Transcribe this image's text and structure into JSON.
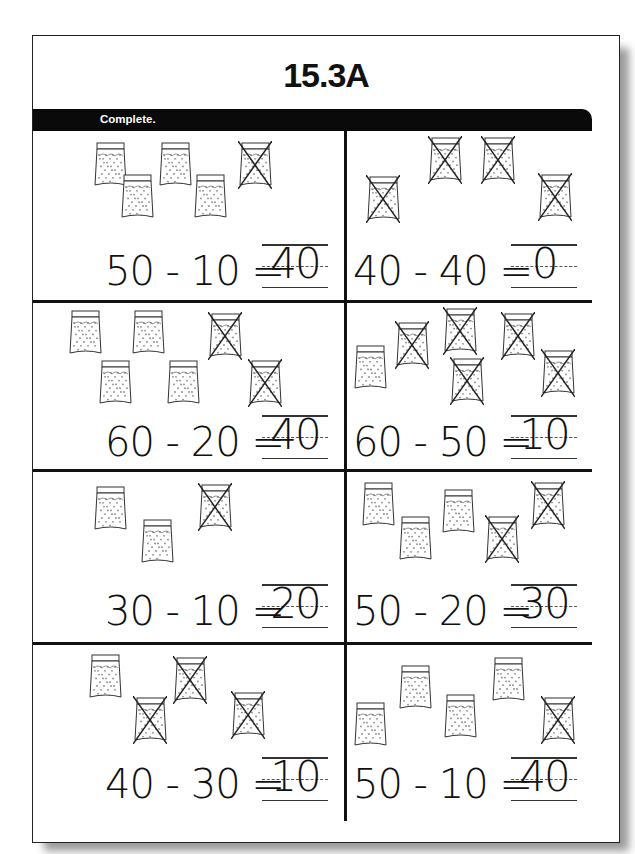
{
  "title": "15.3A",
  "instruction": "Complete.",
  "problems": [
    {
      "equation": "50 - 10 =",
      "answer": "40",
      "bags_total": 5,
      "bags_crossed": 1
    },
    {
      "equation": "40 - 40 =",
      "answer": "0",
      "bags_total": 4,
      "bags_crossed": 4
    },
    {
      "equation": "60 - 20 =",
      "answer": "40",
      "bags_total": 6,
      "bags_crossed": 2
    },
    {
      "equation": "60 - 50 =",
      "answer": "10",
      "bags_total": 6,
      "bags_crossed": 5
    },
    {
      "equation": "30 - 10 =",
      "answer": "20",
      "bags_total": 3,
      "bags_crossed": 1
    },
    {
      "equation": "50 - 20 =",
      "answer": "30",
      "bags_total": 5,
      "bags_crossed": 2
    },
    {
      "equation": "40 - 30 =",
      "answer": "10",
      "bags_total": 4,
      "bags_crossed": 3
    },
    {
      "equation": "50 - 10 =",
      "answer": "40",
      "bags_total": 5,
      "bags_crossed": 1
    }
  ],
  "bag_icon": "bag-of-ten-icon",
  "crossed_icon": "cross-out-icon"
}
